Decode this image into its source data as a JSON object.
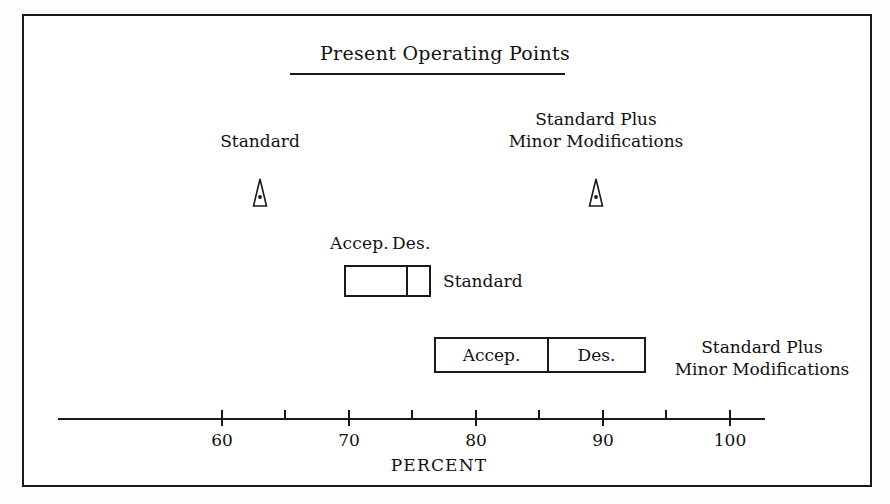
{
  "figure": {
    "title": "Present Operating Points",
    "axis_title": "PERCENT"
  },
  "operating_points": [
    {
      "label": "Standard",
      "value": 63,
      "marker": "triangle-pointer-marker"
    },
    {
      "label_line1": "Standard Plus",
      "label_line2": "Minor Modifications",
      "value": 89.5,
      "marker": "triangle-pointer-marker"
    }
  ],
  "bars": [
    {
      "caption_accep": "Accep.",
      "caption_des": "Des.",
      "label": "Standard",
      "accep_start": 74.5,
      "accep_end": 79.5,
      "des_end": 81.5
    },
    {
      "seg_accep_label": "Accep.",
      "seg_des_label": "Des.",
      "label_line1": "Standard Plus",
      "label_line2": "Minor Modifications",
      "accep_start": 81.5,
      "accep_end": 90.5,
      "des_end": 98
    }
  ],
  "chart_data": {
    "type": "bar",
    "title": "Present Operating Points",
    "xlabel": "PERCENT",
    "ylabel": "",
    "xlim": [
      52,
      103
    ],
    "grid": false,
    "legend": "none",
    "x_major_ticks": [
      60,
      70,
      80,
      90,
      100
    ],
    "x_minor_ticks": [
      65,
      75,
      85,
      95
    ],
    "x_tick_labels": [
      "60",
      "70",
      "80",
      "90",
      "100"
    ],
    "series": [
      {
        "name": "Present Operating Point - Standard",
        "type": "marker",
        "values": [
          63
        ]
      },
      {
        "name": "Present Operating Point - Standard Plus Minor Modifications",
        "type": "marker",
        "values": [
          89.5
        ]
      },
      {
        "name": "Standard - Acceptable range",
        "type": "range",
        "start": 74.5,
        "end": 79.5
      },
      {
        "name": "Standard - Desirable range",
        "type": "range",
        "start": 79.5,
        "end": 81.5
      },
      {
        "name": "Standard Plus Minor Modifications - Acceptable range",
        "type": "range",
        "start": 81.5,
        "end": 90.5
      },
      {
        "name": "Standard Plus Minor Modifications - Desirable range",
        "type": "range",
        "start": 90.5,
        "end": 98
      }
    ]
  },
  "ticks": {
    "major": [
      {
        "label": "60",
        "x": 222
      },
      {
        "label": "70",
        "x": 349
      },
      {
        "label": "80",
        "x": 476
      },
      {
        "label": "90",
        "x": 603
      },
      {
        "label": "100",
        "x": 730
      }
    ],
    "minor": [
      {
        "x": 285
      },
      {
        "x": 412
      },
      {
        "x": 539
      },
      {
        "x": 666
      }
    ]
  }
}
